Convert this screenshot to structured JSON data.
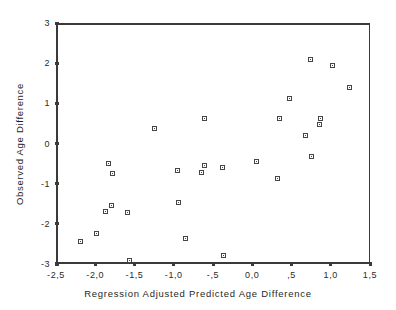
{
  "chart_data": {
    "type": "scatter",
    "title": "",
    "xlabel": "Regression Adjusted Predicted Age Difference",
    "ylabel": "Observed Age Difference",
    "xlim": [
      -2.5,
      1.5
    ],
    "ylim": [
      -3,
      3
    ],
    "xticks": [
      -2.5,
      -2.0,
      -1.5,
      -1.0,
      -0.5,
      0.0,
      0.5,
      1.0,
      1.5
    ],
    "xticklabels": [
      "-2,5",
      "-2,0",
      "-1,5",
      "-1,0",
      "-,5",
      "0,0",
      ",5",
      "1,0",
      "1,5"
    ],
    "yticks": [
      3,
      2,
      1,
      0,
      -1,
      -2,
      -3
    ],
    "yticklabels": [
      "3",
      "2",
      "1",
      "0",
      "-1",
      "-2",
      "-3"
    ],
    "grid": false,
    "legend": null,
    "marker": "open-square",
    "marker_color": "#454545",
    "series": [
      {
        "name": "observations",
        "points": [
          {
            "x": -2.21,
            "y": -2.4
          },
          {
            "x": -2.01,
            "y": -2.19
          },
          {
            "x": -1.9,
            "y": -1.64
          },
          {
            "x": -1.86,
            "y": -0.46
          },
          {
            "x": -1.82,
            "y": -1.49
          },
          {
            "x": -1.8,
            "y": -0.69
          },
          {
            "x": -1.61,
            "y": -1.66
          },
          {
            "x": -1.59,
            "y": -2.86
          },
          {
            "x": -1.27,
            "y": 0.42
          },
          {
            "x": -0.98,
            "y": -0.61
          },
          {
            "x": -0.96,
            "y": -1.43
          },
          {
            "x": -0.88,
            "y": -2.31
          },
          {
            "x": -0.67,
            "y": -0.68
          },
          {
            "x": -0.64,
            "y": 0.68
          },
          {
            "x": -0.63,
            "y": -0.5
          },
          {
            "x": -0.41,
            "y": -0.56
          },
          {
            "x": -0.39,
            "y": -2.75
          },
          {
            "x": 0.03,
            "y": -0.41
          },
          {
            "x": 0.3,
            "y": -0.83
          },
          {
            "x": 0.32,
            "y": 0.68
          },
          {
            "x": 0.45,
            "y": 1.17
          },
          {
            "x": 0.65,
            "y": 0.25
          },
          {
            "x": 0.72,
            "y": 2.13
          },
          {
            "x": 0.73,
            "y": -0.28
          },
          {
            "x": 0.83,
            "y": 0.52
          },
          {
            "x": 0.85,
            "y": 0.68
          },
          {
            "x": 1.0,
            "y": 1.99
          },
          {
            "x": 1.21,
            "y": 1.45
          }
        ]
      }
    ]
  }
}
